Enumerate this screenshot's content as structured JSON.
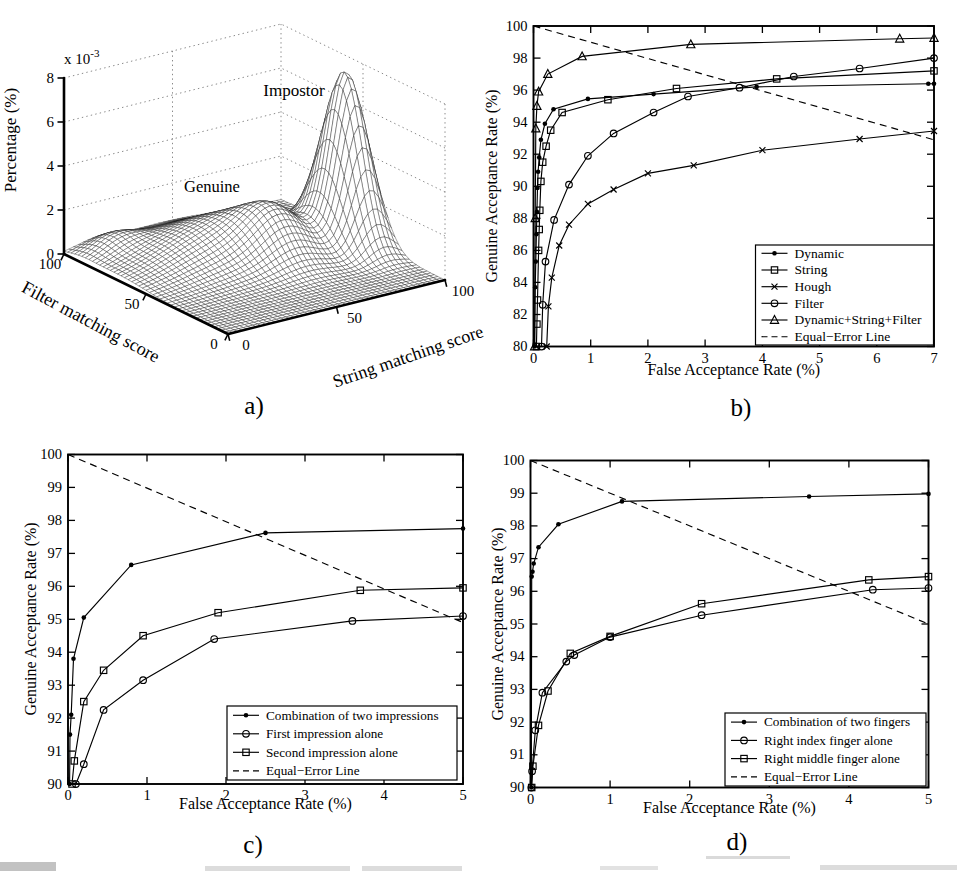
{
  "page": {
    "width": 957,
    "height": 873,
    "background": "#ffffff",
    "ink": "#000000",
    "grid_dot_color": "#8a8a8a"
  },
  "captions": {
    "a": "a)",
    "b": "b)",
    "c": "c)",
    "d": "d)"
  },
  "chart_data": [
    {
      "id": "a",
      "type": "surface",
      "zlabel": "Percentage (%)",
      "z_scale": {
        "base": "x 10",
        "exponent": "-3"
      },
      "xlabel": "String matching score",
      "ylabel": "Filter matching score",
      "zlim_e3": [
        0,
        8
      ],
      "z_ticks": [
        0,
        2,
        4,
        6,
        8
      ],
      "string_ticks": [
        100,
        50,
        0
      ],
      "filter_ticks": [
        100,
        50,
        0
      ],
      "annotations": [
        {
          "text": "Genuine"
        },
        {
          "text": "Impostor"
        }
      ],
      "grid_n": 46,
      "surface_components": [
        {
          "name": "genuine-broad",
          "amp_e3": 1.6,
          "s0": 55,
          "f0": 68,
          "sigma_s": 24,
          "sigma_f": 18
        },
        {
          "name": "genuine-ridge",
          "amp_e3": 1.6,
          "s0": 39,
          "f0": 51,
          "sigma_s": 11,
          "sigma_f": 12
        },
        {
          "name": "left-ripple",
          "amp_e3": 0.6,
          "s0": 85,
          "f0": 90,
          "sigma_s": 9,
          "sigma_f": 8
        },
        {
          "name": "impostor-peak",
          "amp_e3": 7.7,
          "s0": 8,
          "f0": 50,
          "sigma_s": 7,
          "sigma_f": 11
        }
      ]
    },
    {
      "id": "b",
      "type": "line",
      "xlabel": "False Acceptance Rate (%)",
      "ylabel": "Genuine Acceptance Rate (%)",
      "xlim": [
        0,
        7
      ],
      "ylim": [
        80,
        100
      ],
      "xticks": [
        0,
        1,
        2,
        3,
        4,
        5,
        6,
        7
      ],
      "yticks": [
        80,
        82,
        84,
        86,
        88,
        90,
        92,
        94,
        96,
        98,
        100
      ],
      "legend_position": "lower-right",
      "series": [
        {
          "name": "Dynamic",
          "marker": "dot",
          "dashed": false,
          "points": [
            [
              0.02,
              80
            ],
            [
              0.03,
              83.7
            ],
            [
              0.04,
              85.3
            ],
            [
              0.05,
              87.0
            ],
            [
              0.06,
              88.4
            ],
            [
              0.07,
              89.9
            ],
            [
              0.08,
              90.9
            ],
            [
              0.1,
              91.8
            ],
            [
              0.13,
              92.9
            ],
            [
              0.2,
              93.9
            ],
            [
              0.35,
              94.8
            ],
            [
              0.95,
              95.45
            ],
            [
              2.1,
              95.75
            ],
            [
              3.9,
              96.2
            ],
            [
              6.9,
              96.4
            ],
            [
              7,
              96.4
            ]
          ]
        },
        {
          "name": "String",
          "marker": "square",
          "dashed": false,
          "points": [
            [
              0.05,
              80
            ],
            [
              0.06,
              81.4
            ],
            [
              0.07,
              82.9
            ],
            [
              0.09,
              86.0
            ],
            [
              0.1,
              87.3
            ],
            [
              0.11,
              88.5
            ],
            [
              0.13,
              90.3
            ],
            [
              0.16,
              91.5
            ],
            [
              0.22,
              92.5
            ],
            [
              0.3,
              93.5
            ],
            [
              0.5,
              94.6
            ],
            [
              1.3,
              95.4
            ],
            [
              2.5,
              96.1
            ],
            [
              4.25,
              96.7
            ],
            [
              7,
              97.2
            ]
          ]
        },
        {
          "name": "Hough",
          "marker": "x",
          "dashed": false,
          "points": [
            [
              0.23,
              80
            ],
            [
              0.26,
              82.5
            ],
            [
              0.32,
              84.3
            ],
            [
              0.45,
              86.3
            ],
            [
              0.62,
              87.6
            ],
            [
              0.95,
              88.9
            ],
            [
              1.4,
              89.8
            ],
            [
              2.0,
              90.8
            ],
            [
              2.8,
              91.3
            ],
            [
              4.0,
              92.25
            ],
            [
              5.7,
              92.95
            ],
            [
              7,
              93.45
            ]
          ]
        },
        {
          "name": "Filter",
          "marker": "circle",
          "dashed": false,
          "points": [
            [
              0.14,
              80
            ],
            [
              0.16,
              82.6
            ],
            [
              0.21,
              85.3
            ],
            [
              0.36,
              87.9
            ],
            [
              0.62,
              90.1
            ],
            [
              0.95,
              91.9
            ],
            [
              1.4,
              93.3
            ],
            [
              2.1,
              94.6
            ],
            [
              2.7,
              95.6
            ],
            [
              3.6,
              96.15
            ],
            [
              4.55,
              96.85
            ],
            [
              5.7,
              97.35
            ],
            [
              7,
              98.0
            ]
          ]
        },
        {
          "name": "Dynamic+String+Filter",
          "marker": "triangle",
          "dashed": false,
          "points": [
            [
              0.02,
              80
            ],
            [
              0.03,
              88
            ],
            [
              0.04,
              93.6
            ],
            [
              0.06,
              95.0
            ],
            [
              0.09,
              95.9
            ],
            [
              0.25,
              97.0
            ],
            [
              0.85,
              98.1
            ],
            [
              2.75,
              98.85
            ],
            [
              6.4,
              99.2
            ],
            [
              7,
              99.25
            ]
          ]
        },
        {
          "name": "Equal−Error Line",
          "marker": "none",
          "dashed": true,
          "points": [
            [
              0,
              100
            ],
            [
              7,
              92.9
            ]
          ]
        }
      ]
    },
    {
      "id": "c",
      "type": "line",
      "xlabel": "False Acceptance Rate (%)",
      "ylabel": "Genuine Acceptance Rate (%)",
      "xlim": [
        0,
        5
      ],
      "ylim": [
        90,
        100
      ],
      "xticks": [
        0,
        1,
        2,
        3,
        4,
        5
      ],
      "yticks": [
        90,
        91,
        92,
        93,
        94,
        95,
        96,
        97,
        98,
        99,
        100
      ],
      "legend_position": "lower-right",
      "series": [
        {
          "name": "Combination of two impressions",
          "marker": "dot",
          "dashed": false,
          "points": [
            [
              0.02,
              90
            ],
            [
              0.025,
              91.5
            ],
            [
              0.04,
              92.1
            ],
            [
              0.07,
              93.8
            ],
            [
              0.2,
              95.05
            ],
            [
              0.8,
              96.65
            ],
            [
              2.5,
              97.62
            ],
            [
              5,
              97.75
            ]
          ]
        },
        {
          "name": "First impression alone",
          "marker": "circle",
          "dashed": false,
          "points": [
            [
              0.1,
              90
            ],
            [
              0.2,
              90.6
            ],
            [
              0.45,
              92.25
            ],
            [
              0.95,
              93.15
            ],
            [
              1.85,
              94.4
            ],
            [
              3.6,
              94.95
            ],
            [
              5,
              95.1
            ]
          ]
        },
        {
          "name": "Second impression alone",
          "marker": "square",
          "dashed": false,
          "points": [
            [
              0.05,
              90
            ],
            [
              0.08,
              90.7
            ],
            [
              0.2,
              92.5
            ],
            [
              0.45,
              93.45
            ],
            [
              0.95,
              94.5
            ],
            [
              1.9,
              95.2
            ],
            [
              3.7,
              95.88
            ],
            [
              5,
              95.95
            ]
          ]
        },
        {
          "name": "Equal−Error Line",
          "marker": "none",
          "dashed": true,
          "points": [
            [
              0,
              100
            ],
            [
              5,
              94.9
            ]
          ]
        }
      ]
    },
    {
      "id": "d",
      "type": "line",
      "xlabel": "False Acceptance Rate (%)",
      "ylabel": "Genuine Acceptance Rate (%)",
      "xlim": [
        0,
        5
      ],
      "ylim": [
        90,
        100
      ],
      "xticks": [
        0,
        1,
        2,
        3,
        4,
        5
      ],
      "yticks": [
        90,
        91,
        92,
        93,
        94,
        95,
        96,
        97,
        98,
        99,
        100
      ],
      "legend_position": "lower-right",
      "series": [
        {
          "name": "Combination of two fingers",
          "marker": "dot",
          "dashed": false,
          "points": [
            [
              0.01,
              90
            ],
            [
              0.015,
              96.45
            ],
            [
              0.025,
              96.6
            ],
            [
              0.04,
              96.85
            ],
            [
              0.1,
              97.35
            ],
            [
              0.35,
              98.05
            ],
            [
              1.15,
              98.75
            ],
            [
              3.5,
              98.9
            ],
            [
              5,
              98.98
            ]
          ]
        },
        {
          "name": "Right index finger alone",
          "marker": "circle",
          "dashed": false,
          "points": [
            [
              0.01,
              90
            ],
            [
              0.02,
              90.5
            ],
            [
              0.06,
              91.75
            ],
            [
              0.15,
              92.9
            ],
            [
              0.45,
              93.85
            ],
            [
              0.55,
              94.05
            ],
            [
              1.0,
              94.6
            ],
            [
              2.15,
              95.27
            ],
            [
              4.3,
              96.05
            ],
            [
              5,
              96.1
            ]
          ]
        },
        {
          "name": "Right middle finger alone",
          "marker": "square",
          "dashed": false,
          "points": [
            [
              0.015,
              90
            ],
            [
              0.03,
              90.65
            ],
            [
              0.1,
              91.9
            ],
            [
              0.22,
              92.95
            ],
            [
              0.5,
              94.1
            ],
            [
              1.0,
              94.62
            ],
            [
              2.15,
              95.62
            ],
            [
              4.25,
              96.35
            ],
            [
              5,
              96.45
            ]
          ]
        },
        {
          "name": "Equal−Error Line",
          "marker": "none",
          "dashed": true,
          "points": [
            [
              0,
              100
            ],
            [
              5,
              95
            ]
          ]
        }
      ]
    }
  ]
}
